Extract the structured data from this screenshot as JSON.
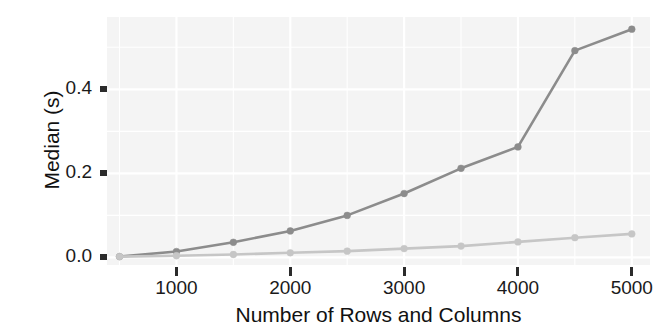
{
  "chart_data": {
    "type": "line",
    "title": "",
    "subtitle": "",
    "xlabel": "Number of Rows and Columns",
    "ylabel": "Median (s)",
    "x": [
      500,
      1000,
      1500,
      2000,
      2500,
      3000,
      3500,
      4000,
      4500,
      5000
    ],
    "series": [
      {
        "name": "upper-series",
        "color": "#8c8c8c",
        "values": [
          0.002,
          0.014,
          0.036,
          0.063,
          0.1,
          0.152,
          0.212,
          0.263,
          0.492,
          0.543
        ]
      },
      {
        "name": "lower-series",
        "color": "#c6c6c6",
        "values": [
          0.002,
          0.004,
          0.007,
          0.011,
          0.015,
          0.021,
          0.027,
          0.037,
          0.047,
          0.056
        ]
      }
    ],
    "xlim": [
      390,
      5160
    ],
    "ylim": [
      -0.018,
      0.572
    ],
    "xticks": [
      1000,
      2000,
      3000,
      4000,
      5000
    ],
    "xtick_labels": [
      "1000",
      "2000",
      "3000",
      "4000",
      "5000"
    ],
    "yticks": [
      0.0,
      0.2,
      0.4
    ],
    "ytick_labels": [
      "0.0",
      "0.2",
      "0.4"
    ],
    "grid": true,
    "grid_color": "#ffffff",
    "panel_background": "#f4f4f4",
    "legend": "none",
    "point_marker": "circle"
  }
}
